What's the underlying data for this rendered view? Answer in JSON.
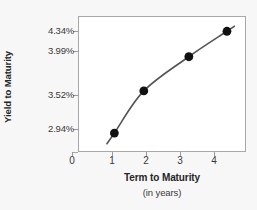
{
  "chart_data": {
    "type": "line",
    "title": "",
    "xlabel": "Term to Maturity",
    "xlabel_sub": "(in years)",
    "ylabel": "Yield to Maturity",
    "x": [
      1.05,
      1.9,
      3.2,
      4.3
    ],
    "y": [
      2.94,
      3.52,
      3.99,
      4.34
    ],
    "point_labels": [
      "2.94%",
      "3.52%",
      "3.99%",
      "4.34%"
    ],
    "xticks": [
      0,
      1,
      2,
      3,
      4
    ],
    "xtick_labels": [
      "0",
      "1",
      "2",
      "3",
      "4"
    ],
    "yticks": [
      2.94,
      3.52,
      3.99,
      4.34
    ],
    "ytick_labels": [
      "2.94%",
      "3.52%",
      "3.99%",
      "4.34%"
    ],
    "xlim": [
      0,
      4.85
    ],
    "ylim": [
      2.68,
      4.55
    ],
    "grid": false,
    "legend": false,
    "series_color": "#555555",
    "marker_color": "#111111",
    "plot_background": "#ffffff",
    "figure_background": "#f7f7f7",
    "axis_color": "#a8a8a8"
  },
  "axis": {
    "y_title": "Yield to Maturity",
    "x_title": "Term to Maturity",
    "x_subtitle": "(in years)",
    "ytick_0": "2.94%",
    "ytick_1": "3.52%",
    "ytick_2": "3.99%",
    "ytick_3": "4.34%",
    "xtick_0": "0",
    "xtick_1": "1",
    "xtick_2": "2",
    "xtick_3": "3",
    "xtick_4": "4"
  }
}
